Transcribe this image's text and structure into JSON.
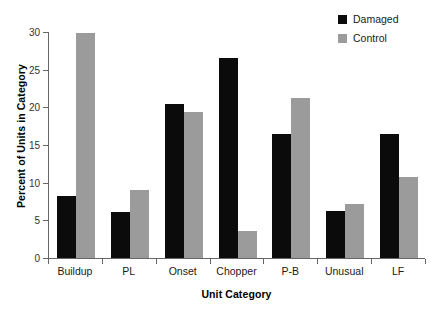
{
  "chart_data": {
    "type": "bar",
    "title": "",
    "xlabel": "Unit Category",
    "ylabel": "Percent of Units in Category",
    "categories": [
      "Buildup",
      "PL",
      "Onset",
      "Chopper",
      "P-B",
      "Unusual",
      "LF"
    ],
    "series": [
      {
        "name": "Damaged",
        "color": "#0b0b0b",
        "values": [
          8.2,
          6.1,
          20.5,
          26.6,
          16.4,
          6.2,
          16.4
        ]
      },
      {
        "name": "Control",
        "color": "#9b9b9b",
        "values": [
          29.9,
          9.0,
          19.4,
          3.6,
          21.2,
          7.2,
          10.7
        ]
      }
    ],
    "ylim": [
      0,
      30
    ],
    "ytick_values": [
      0,
      5,
      10,
      15,
      20,
      25,
      30
    ],
    "ytick_labels": [
      "0",
      "5",
      "10",
      "15",
      "20",
      "25",
      "30"
    ],
    "grid": false,
    "legend_position": "top-right"
  },
  "legend": {
    "entries": [
      {
        "label": "Damaged",
        "swatch": "damaged"
      },
      {
        "label": "Control",
        "swatch": "control"
      }
    ]
  }
}
